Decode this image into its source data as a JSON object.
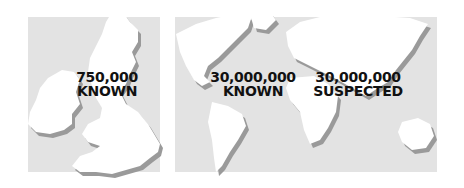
{
  "panels": [
    {
      "id": "uk",
      "region": "United Kingdom and Ireland",
      "count": "750,000",
      "status": "KNOWN"
    },
    {
      "id": "world-known",
      "region": "World",
      "count": "30,000,000",
      "status": "KNOWN"
    },
    {
      "id": "world-suspected",
      "region": "World",
      "count": "30,000,000",
      "status": "SUSPECTED"
    }
  ],
  "colors": {
    "panel_background": "#e3e3e3",
    "land": "#ffffff",
    "shadow": "#9a9a9a",
    "text": "#111111"
  }
}
